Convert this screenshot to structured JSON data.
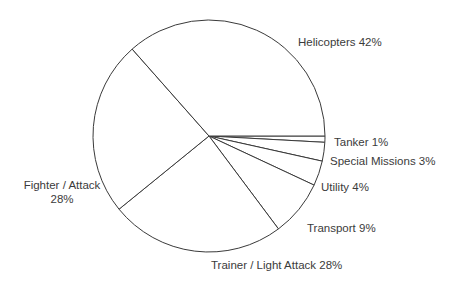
{
  "chart_data": {
    "type": "pie",
    "title": "",
    "subtitle": "",
    "xlabel": "",
    "ylabel": "",
    "legend_position": "none",
    "grid": false,
    "units": "percent",
    "total": 100,
    "categories": [
      "Tanker",
      "Special Missions",
      "Utility",
      "Transport",
      "Trainer / Light Attack",
      "Fighter / Attack",
      "Helicopters"
    ],
    "values": [
      1,
      3,
      4,
      9,
      28,
      28,
      42
    ],
    "start_angle_deg": 0,
    "direction": "clockwise",
    "slice_fill": "#ffffff",
    "slice_stroke": "#3a3a3a",
    "label_color": "#3b3b3b",
    "background": "#ffffff",
    "slices": [
      {
        "name": "Tanker",
        "value": 1,
        "label": "Tanker 1%",
        "percent_text": "1%"
      },
      {
        "name": "Special Missions",
        "value": 3,
        "label": "Special Missions 3%",
        "percent_text": "3%"
      },
      {
        "name": "Utility",
        "value": 4,
        "label": "Utility 4%",
        "percent_text": "4%"
      },
      {
        "name": "Transport",
        "value": 9,
        "label": "Transport 9%",
        "percent_text": "9%"
      },
      {
        "name": "Trainer / Light Attack",
        "value": 28,
        "label": "Trainer / Light Attack 28%",
        "percent_text": "28%"
      },
      {
        "name": "Fighter / Attack",
        "value": 28,
        "label": "Fighter / Attack 28%",
        "percent_text": "28%"
      },
      {
        "name": "Helicopters",
        "value": 42,
        "label": "Helicopters 42%",
        "percent_text": "42%"
      }
    ]
  },
  "labels": {
    "helicopters": "Helicopters 42%",
    "tanker": "Tanker 1%",
    "special_missions": "Special Missions 3%",
    "utility": "Utility 4%",
    "transport": "Transport 9%",
    "trainer_light_attack": "Trainer / Light Attack 28%",
    "fighter_attack_line1": "Fighter / Attack",
    "fighter_attack_line2": "28%"
  }
}
